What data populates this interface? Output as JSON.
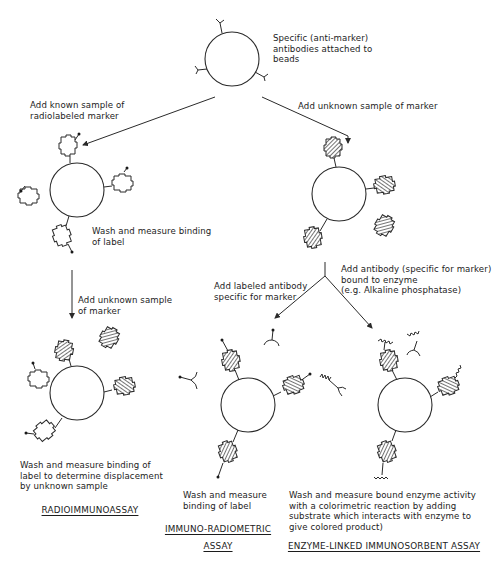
{
  "diagram": {
    "top": {
      "caption": "Specific (anti-marker)\nantibodies attached to\nbeads"
    },
    "branch_left": {
      "arrow_label": "Add known sample of\nradiolabeled marker",
      "step_caption": "Wash and measure binding\nof label",
      "down_arrow_label": "Add unknown sample\nof marker",
      "final_caption": "Wash and measure binding of\nlabel to determine displacement\nby unknown sample",
      "assay_title": "RADIOIMMUNOASSAY"
    },
    "branch_right": {
      "arrow_label": "Add unknown sample of marker",
      "split": {
        "left_label": "Add labeled antibody\nspecific for marker",
        "right_label": "Add antibody (specific for marker)\nbound to enzyme\n(e.g. Alkaline phosphatase)"
      },
      "irma": {
        "caption": "Wash and measure\nbinding of label",
        "assay_title": "IMMUNO-RADIOMETRIC\nASSAY"
      },
      "elisa": {
        "caption": "Wash and measure bound enzyme activity\nwith a colorimetric reaction by adding\nsubstrate which interacts with enzyme to\ngive colored product)",
        "assay_title": "ENZYME-LINKED IMMUNOSORBENT ASSAY"
      }
    },
    "legend_glyphs": {
      "bead": "circle",
      "antibody": "Y-shaped fork",
      "radiolabeled_marker": "open cross-shaped outline with dot",
      "unknown_marker": "hatched cross-shaped block",
      "enzyme": "zigzag line"
    },
    "colors": {
      "ink": "#1c1c1c",
      "background": "#ffffff"
    }
  }
}
